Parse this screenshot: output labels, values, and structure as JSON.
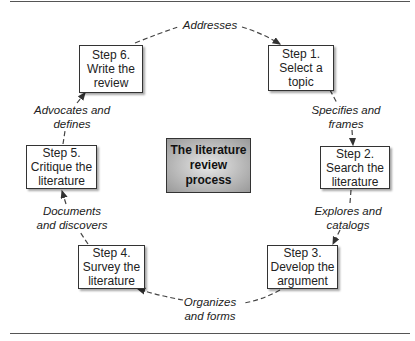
{
  "center": {
    "line1": "The literature",
    "line2": "review process"
  },
  "steps": [
    {
      "title": "Step 1.",
      "line2": "Select a",
      "line3": "topic"
    },
    {
      "title": "Step 2.",
      "line2": "Search the",
      "line3": "literature"
    },
    {
      "title": "Step 3.",
      "line2": "Develop the",
      "line3": "argument"
    },
    {
      "title": "Step 4.",
      "line2": "Survey the",
      "line3": "literature"
    },
    {
      "title": "Step 5.",
      "line2": "Critique the",
      "line3": "literature"
    },
    {
      "title": "Step 6.",
      "line2": "Write the",
      "line3": "review"
    }
  ],
  "transitions": [
    {
      "from": "Step 6",
      "to": "Step 1",
      "line1": "Addresses",
      "line2": ""
    },
    {
      "from": "Step 1",
      "to": "Step 2",
      "line1": "Specifies and",
      "line2": "frames"
    },
    {
      "from": "Step 2",
      "to": "Step 3",
      "line1": "Explores and",
      "line2": "catalogs"
    },
    {
      "from": "Step 3",
      "to": "Step 4",
      "line1": "Organizes",
      "line2": "and forms"
    },
    {
      "from": "Step 4",
      "to": "Step 5",
      "line1": "Documents",
      "line2": "and discovers"
    },
    {
      "from": "Step 5",
      "to": "Step 6",
      "line1": "Advocates and",
      "line2": "defines"
    }
  ],
  "colors": {
    "rule": "#555555",
    "border": "#333333",
    "center_fill": "#b8b8b8",
    "text": "#222222"
  }
}
